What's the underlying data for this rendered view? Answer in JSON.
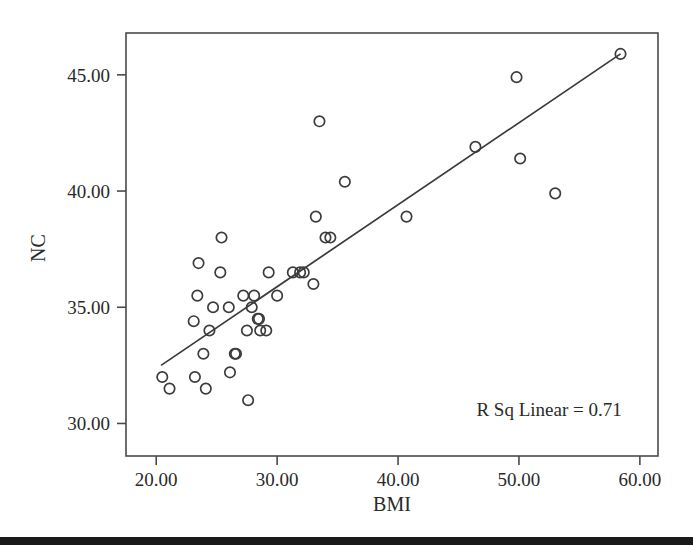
{
  "chart_data": {
    "type": "scatter",
    "title": "",
    "xlabel": "BMI",
    "ylabel": "NC",
    "xlim": [
      17.5,
      61.5
    ],
    "ylim": [
      28.6,
      46.8
    ],
    "xticks": [
      "20.00",
      "30.00",
      "40.00",
      "50.00",
      "60.00"
    ],
    "xtick_values": [
      20,
      30,
      40,
      50,
      60
    ],
    "yticks": [
      "30.00",
      "35.00",
      "40.00",
      "45.00"
    ],
    "ytick_values": [
      30,
      35,
      40,
      45
    ],
    "grid": false,
    "legend": null,
    "annotations": [
      {
        "name": "r-squared-annotation",
        "text": "R Sq Linear = 0.71",
        "x": 58.5,
        "y": 30.3,
        "align": "right"
      }
    ],
    "fit_line": {
      "name": "linear-fit-line",
      "r_squared": 0.71,
      "x_start": 20.4,
      "y_start": 32.5,
      "x_end": 58.4,
      "y_end": 45.9
    },
    "points": [
      [
        20.5,
        32.0
      ],
      [
        21.1,
        31.5
      ],
      [
        23.1,
        34.4
      ],
      [
        23.2,
        32.0
      ],
      [
        23.4,
        35.5
      ],
      [
        23.5,
        36.9
      ],
      [
        23.9,
        33.0
      ],
      [
        24.1,
        31.5
      ],
      [
        24.4,
        34.0
      ],
      [
        24.7,
        35.0
      ],
      [
        25.3,
        36.5
      ],
      [
        25.4,
        38.0
      ],
      [
        26.0,
        35.0
      ],
      [
        26.1,
        32.2
      ],
      [
        26.5,
        33.0
      ],
      [
        26.6,
        33.0
      ],
      [
        27.2,
        35.5
      ],
      [
        27.5,
        34.0
      ],
      [
        27.6,
        31.0
      ],
      [
        27.9,
        35.0
      ],
      [
        28.1,
        35.5
      ],
      [
        28.4,
        34.5
      ],
      [
        28.5,
        34.5
      ],
      [
        28.6,
        34.0
      ],
      [
        29.1,
        34.0
      ],
      [
        29.3,
        36.5
      ],
      [
        30.0,
        35.5
      ],
      [
        31.3,
        36.5
      ],
      [
        31.9,
        36.5
      ],
      [
        32.2,
        36.5
      ],
      [
        33.0,
        36.0
      ],
      [
        33.2,
        38.9
      ],
      [
        33.5,
        43.0
      ],
      [
        34.0,
        38.0
      ],
      [
        34.4,
        38.0
      ],
      [
        35.6,
        40.4
      ],
      [
        40.7,
        38.9
      ],
      [
        46.4,
        41.9
      ],
      [
        49.8,
        44.9
      ],
      [
        50.1,
        41.4
      ],
      [
        53.0,
        39.9
      ],
      [
        58.4,
        45.9
      ]
    ]
  },
  "figure": {
    "background_color": "#ffffff",
    "axis_color": "#4a4a4a",
    "point_color": "#3c3c3c",
    "line_color": "#3a3a3a",
    "footer_bar_color": "#1a1a1a"
  }
}
